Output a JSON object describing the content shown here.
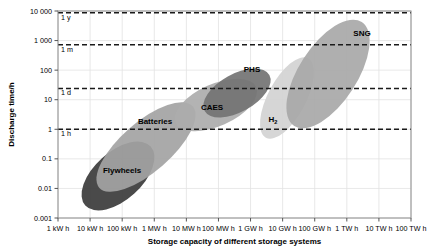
{
  "chart_data": {
    "type": "scatter",
    "title": "",
    "xlabel": "Storage capacity of different storage systems",
    "ylabel": "Discharge time/h",
    "grid": true,
    "legend_position": "none",
    "x_tick_labels": [
      "1 kW h",
      "10 kW h",
      "100 kW h",
      "1 MW h",
      "10 MW h",
      "100 MW h",
      "1 GW h",
      "10 GW h",
      "100 GW h",
      "1 TW h",
      "10 TW h",
      "100 TW h"
    ],
    "y_tick_labels": [
      "10 000",
      "1 000",
      "100",
      "10",
      "1",
      "0.1",
      "0.01",
      "0.001"
    ],
    "xlim_log10": [
      0,
      11
    ],
    "ylim_log10": [
      -3,
      4
    ],
    "x_log_decades": 11,
    "y_log_decades": 7,
    "reference_lines": [
      {
        "label": "1 y",
        "value_hours": 8760,
        "style": "dashed"
      },
      {
        "label": "1 m",
        "value_hours": 720,
        "style": "dashed"
      },
      {
        "label": "1 d",
        "value_hours": 24,
        "style": "dashed"
      },
      {
        "label": "1 h",
        "value_hours": 1,
        "style": "dashed"
      }
    ],
    "regions": [
      {
        "name": "Flywheels",
        "label": "Flywheels",
        "color": "#3b3b3b",
        "cx": 118,
        "cy": 176,
        "rx": 44,
        "ry": 24,
        "rotation": -42,
        "label_x": 122,
        "label_y": 173
      },
      {
        "name": "Batteries",
        "label": "Batteries",
        "color": "#a3a3a3",
        "cx": 146,
        "cy": 147,
        "rx": 62,
        "ry": 25,
        "rotation": -41,
        "label_x": 155,
        "label_y": 124
      },
      {
        "name": "CAES",
        "label": "CAES",
        "color": "#adadad",
        "cx": 216,
        "cy": 105,
        "rx": 44,
        "ry": 21,
        "rotation": -24,
        "label_x": 212,
        "label_y": 110
      },
      {
        "name": "PHS",
        "label": "PHS",
        "color": "#737373",
        "cx": 237,
        "cy": 93,
        "rx": 37,
        "ry": 19,
        "rotation": -29,
        "label_x": 252,
        "label_y": 72
      },
      {
        "name": "H2",
        "label": "H",
        "label_sub": "2",
        "color": "#d2d2d2",
        "cx": 287,
        "cy": 98,
        "rx": 45,
        "ry": 19,
        "rotation": -62,
        "label_x": 273,
        "label_y": 122
      },
      {
        "name": "SNG",
        "label": "SNG",
        "color": "#a8a8a8",
        "cx": 328,
        "cy": 74,
        "rx": 62,
        "ry": 29,
        "rotation": -57,
        "label_x": 362,
        "label_y": 36
      }
    ]
  },
  "axes": {
    "y_title": "Discharge time/h",
    "x_title": "Storage capacity of different storage systems"
  },
  "colors": {
    "frame": "#8c8c8c",
    "grid": "#e2e2e2",
    "dashed": "#1a1a1a",
    "text": "#000000",
    "background": "#ffffff"
  }
}
